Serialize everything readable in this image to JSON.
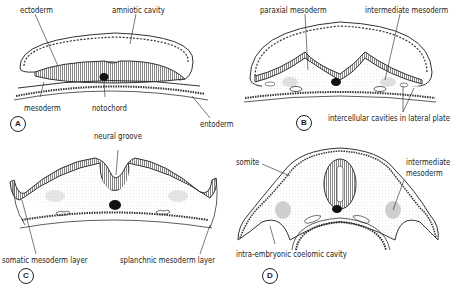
{
  "figure": {
    "panels": [
      {
        "id": "A",
        "labels": {
          "ectoderm": "ectoderm",
          "amniotic_cavity": "amniotic cavity",
          "mesoderm": "mesoderm",
          "notochord": "notochord",
          "entoderm": "entoderm"
        }
      },
      {
        "id": "B",
        "labels": {
          "paraxial_mesoderm": "paraxial   mesoderm",
          "intermediate_mesoderm": "intermediate  mesoderm",
          "intercellular_cavities": "intercellular cavities in lateral plate"
        }
      },
      {
        "id": "C",
        "labels": {
          "neural_groove": "neural groove",
          "somatic_mesoderm": "somatic mesoderm layer",
          "splanchnic_mesoderm": "splanchnic mesoderm layer"
        }
      },
      {
        "id": "D",
        "labels": {
          "somite": "somite",
          "intermediate_mesoderm_1": "intermediate",
          "intermediate_mesoderm_2": "mesoderm",
          "coelomic_cavity": "intra-embryonic coelomic cavity"
        }
      }
    ]
  }
}
